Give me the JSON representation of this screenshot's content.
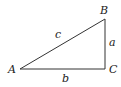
{
  "diagram": {
    "type": "right-triangle",
    "vertices": {
      "A": {
        "label": "A",
        "x": 20,
        "y": 69
      },
      "B": {
        "label": "B",
        "x": 105,
        "y": 19
      },
      "C": {
        "label": "C",
        "x": 105,
        "y": 69
      }
    },
    "sides": {
      "a": {
        "label": "a",
        "from": "B",
        "to": "C"
      },
      "b": {
        "label": "b",
        "from": "A",
        "to": "C"
      },
      "c": {
        "label": "c",
        "from": "A",
        "to": "B"
      }
    },
    "stroke_color": "#333333"
  }
}
